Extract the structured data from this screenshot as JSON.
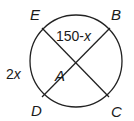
{
  "diagram": {
    "type": "circle-with-intersecting-chords",
    "colors": {
      "stroke": "#222222",
      "text": "#1a1a1a",
      "background": "#ffffff"
    },
    "circle": {
      "cx": 76,
      "cy": 61,
      "r": 46
    },
    "points": {
      "E": {
        "label": "E",
        "x": 42,
        "y": 28
      },
      "B": {
        "label": "B",
        "x": 110,
        "y": 28
      },
      "D": {
        "label": "D",
        "x": 42,
        "y": 97
      },
      "C": {
        "label": "C",
        "x": 109,
        "y": 97
      },
      "A": {
        "label": "A",
        "x": 76,
        "y": 63
      }
    },
    "chords": [
      {
        "from": "E",
        "to": "C"
      },
      {
        "from": "D",
        "to": "B"
      }
    ],
    "arc_labels": {
      "arc_EB": {
        "num": "150-",
        "var": "x"
      },
      "arc_ED": {
        "num": "2",
        "var": "x"
      }
    }
  }
}
